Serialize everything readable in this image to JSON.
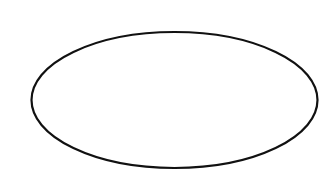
{
  "diagram": {
    "background": "#ffffff",
    "shapes": [
      {
        "type": "ellipse",
        "label": "",
        "cx": 174.5,
        "cy": 100,
        "rx": 143,
        "ry": 68,
        "stroke": "#111111",
        "stroke_width": 2.2,
        "fill": "none"
      }
    ]
  }
}
